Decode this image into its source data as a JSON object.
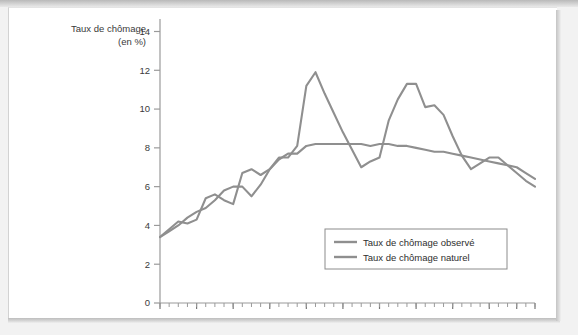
{
  "page": {
    "background_color": "#ffffff",
    "frame_color": "#f2f2f2"
  },
  "chart_data": {
    "type": "line",
    "title": "",
    "xlabel": "",
    "ylabel": "Taux de chômage (en %)",
    "ylabel_line1": "Taux de chômage",
    "ylabel_line2": "(en %)",
    "xlim": [
      1966,
      2007
    ],
    "ylim": [
      0,
      14
    ],
    "y_ticks": [
      0,
      2,
      4,
      6,
      8,
      10,
      12,
      14
    ],
    "y_tick_labels": [
      "0",
      "2",
      "4",
      "6",
      "8",
      "10",
      "12",
      "14"
    ],
    "x_tick_labels": [
      "1966",
      "1970",
      "1974",
      "1978",
      "1982",
      "1986",
      "1990",
      "1994",
      "1998",
      "2002",
      "2005",
      "2007"
    ],
    "x_tick_values": [
      1966,
      1970,
      1974,
      1978,
      1982,
      1986,
      1990,
      1994,
      1998,
      2002,
      2005,
      2007
    ],
    "x_minor_step": 1,
    "grid": false,
    "legend_position": "inside-bottom-right",
    "line_color": "#8f8f8f",
    "axis_color": "#9a9a9a",
    "x": [
      1966,
      1967,
      1968,
      1969,
      1970,
      1971,
      1972,
      1973,
      1974,
      1975,
      1976,
      1977,
      1978,
      1979,
      1980,
      1981,
      1982,
      1983,
      1984,
      1985,
      1986,
      1987,
      1988,
      1989,
      1990,
      1991,
      1992,
      1993,
      1994,
      1995,
      1996,
      1997,
      1998,
      1999,
      2000,
      2001,
      2002,
      2003,
      2004,
      2005,
      2006,
      2007
    ],
    "series": [
      {
        "name": "Taux de chômage observé",
        "color": "#8f8f8f",
        "values": [
          3.4,
          3.8,
          4.2,
          4.1,
          4.3,
          5.4,
          5.6,
          5.3,
          5.1,
          6.7,
          6.9,
          6.6,
          6.9,
          7.5,
          7.5,
          8.1,
          11.2,
          11.9,
          10.8,
          9.8,
          8.8,
          7.9,
          7.0,
          7.3,
          7.5,
          9.4,
          10.5,
          11.3,
          11.3,
          10.1,
          10.2,
          9.7,
          8.6,
          7.6,
          6.9,
          7.2,
          7.5,
          7.5,
          7.1,
          6.7,
          6.3,
          6.0
        ]
      },
      {
        "name": "Taux de chômage naturel",
        "color": "#8f8f8f",
        "values": [
          3.4,
          3.7,
          4.0,
          4.4,
          4.7,
          4.9,
          5.3,
          5.8,
          6.0,
          6.0,
          5.5,
          6.1,
          6.9,
          7.4,
          7.7,
          7.7,
          8.1,
          8.2,
          8.2,
          8.2,
          8.2,
          8.2,
          8.2,
          8.1,
          8.2,
          8.2,
          8.1,
          8.1,
          8.0,
          7.9,
          7.8,
          7.8,
          7.7,
          7.6,
          7.5,
          7.4,
          7.3,
          7.2,
          7.1,
          7.0,
          6.7,
          6.4
        ]
      }
    ],
    "legend": [
      {
        "label": "Taux de chômage observé",
        "color": "#8f8f8f"
      },
      {
        "label": "Taux de chômage naturel",
        "color": "#8f8f8f"
      }
    ]
  }
}
